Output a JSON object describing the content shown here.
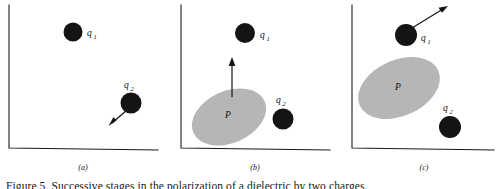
{
  "figure": {
    "domain_kind": "physics-diagram",
    "background_color": "#ffffff",
    "ink_color": "#141414",
    "blob_fill_color": "#b6b6b6",
    "caption_partial": "Figure 5. Successive stages in the polarization of a dielectric by two charges.",
    "panels": [
      {
        "id": "a",
        "label": "(a)",
        "charges": [
          {
            "name": "q1",
            "label": "q",
            "subscript": "1"
          },
          {
            "name": "q2",
            "label": "q",
            "subscript": "2"
          }
        ],
        "blob_label": null,
        "arrow_description": "q2 velocity arrow pointing down-left"
      },
      {
        "id": "b",
        "label": "(b)",
        "charges": [
          {
            "name": "q1",
            "label": "q",
            "subscript": "1"
          },
          {
            "name": "q2",
            "label": "q",
            "subscript": "2"
          }
        ],
        "blob_label": "P",
        "arrow_description": "polarization arrow pointing straight up from blob toward q1"
      },
      {
        "id": "c",
        "label": "(c)",
        "charges": [
          {
            "name": "q1",
            "label": "q",
            "subscript": "1"
          },
          {
            "name": "q2",
            "label": "q",
            "subscript": "2"
          }
        ],
        "blob_label": "P",
        "arrow_description": "q1 velocity arrow pointing up-right"
      }
    ]
  }
}
